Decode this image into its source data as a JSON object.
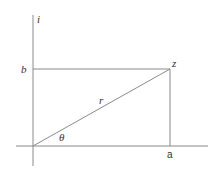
{
  "diagram": {
    "colors": {
      "line": "#8a8a8a",
      "text": "#333333",
      "background": "#ffffff"
    },
    "labels": {
      "imag_axis": "i",
      "imag_component": "b",
      "real_component": "a",
      "point": "z",
      "modulus": "r",
      "angle": "θ"
    },
    "geometry": {
      "origin": [
        33,
        146
      ],
      "point_z": [
        170,
        69
      ],
      "vertical_axis": {
        "x": 33,
        "y1": 15,
        "y2": 166
      },
      "horizontal_axis": {
        "y": 146,
        "x1": 16,
        "x2": 208
      }
    }
  }
}
